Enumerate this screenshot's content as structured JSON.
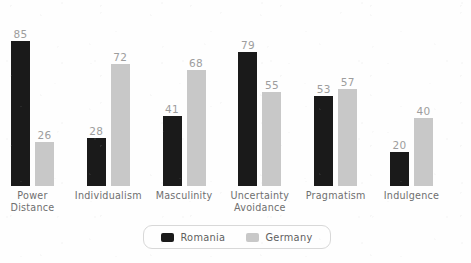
{
  "chart_data": {
    "type": "bar",
    "title": "",
    "subtitle": "",
    "xlabel": "",
    "ylabel": "",
    "ylim": [
      0,
      100
    ],
    "grid": false,
    "legend_position": "bottom",
    "categories": [
      "Power\nDistance",
      "Individualism",
      "Masculinity",
      "Uncertainty\nAvoidance",
      "Pragmatism",
      "Indulgence"
    ],
    "series": [
      {
        "name": "Romania",
        "color": "#1a1a1a",
        "values": [
          85,
          28,
          41,
          79,
          53,
          20
        ]
      },
      {
        "name": "Germany",
        "color": "#c8c8c8",
        "values": [
          26,
          72,
          68,
          55,
          57,
          40
        ]
      }
    ],
    "value_label_color": "#9d9d9d"
  },
  "legend": {
    "items": [
      {
        "label": "Romania",
        "swatch": "romania"
      },
      {
        "label": "Germany",
        "swatch": "germany"
      }
    ]
  }
}
